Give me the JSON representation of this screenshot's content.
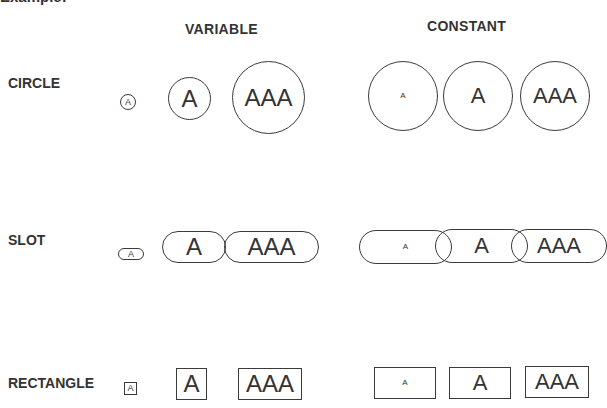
{
  "title": "Example:",
  "columns": [
    {
      "label": "VARIABLE"
    },
    {
      "label": "CONSTANT"
    }
  ],
  "rows": [
    {
      "label": "CIRCLE"
    },
    {
      "label": "SLOT"
    },
    {
      "label": "RECTANGLE"
    }
  ],
  "shapes": {
    "circle": {
      "variable": [
        {
          "text": "A"
        },
        {
          "text": "A"
        },
        {
          "text": "AAA"
        }
      ],
      "constant": [
        {
          "text": "A"
        },
        {
          "text": "A"
        },
        {
          "text": "AAA"
        }
      ]
    },
    "slot": {
      "variable": [
        {
          "text": "A"
        },
        {
          "text": "A"
        },
        {
          "text": "AAA"
        }
      ],
      "constant": [
        {
          "text": "A"
        },
        {
          "text": "A"
        },
        {
          "text": "AAA"
        }
      ]
    },
    "rectangle": {
      "variable": [
        {
          "text": "A"
        },
        {
          "text": "A"
        },
        {
          "text": "AAA"
        }
      ],
      "constant": [
        {
          "text": "A"
        },
        {
          "text": "A"
        },
        {
          "text": "AAA"
        }
      ]
    }
  },
  "colors": {
    "stroke": "#3a3a3a",
    "text": "#333333",
    "background": "#ffffff"
  }
}
